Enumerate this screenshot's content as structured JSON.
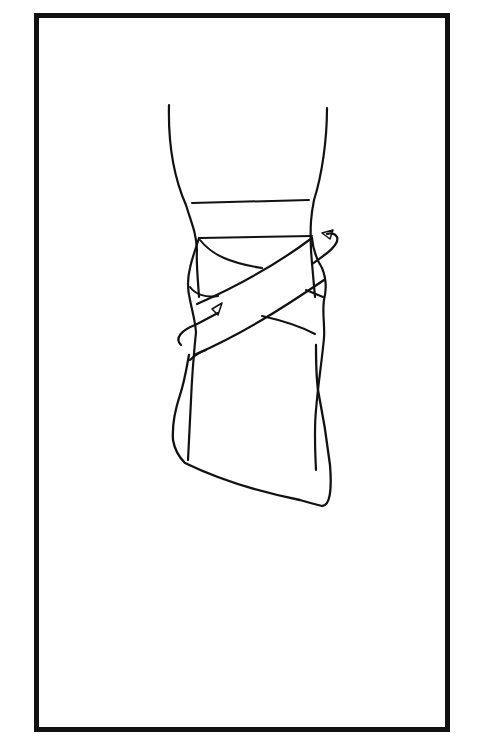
{
  "figure": {
    "frame": {
      "x": 36,
      "y": 15,
      "width": 412,
      "height": 715,
      "stroke_width": 5,
      "color": "#111111"
    },
    "stroke_color": "#111111",
    "background": "#ffffff",
    "elements": [
      "leg-outline",
      "circular-anchor-band",
      "figure-eight-crossing-strap",
      "upper-direction-arrow",
      "lower-direction-arrow",
      "foot-outline"
    ]
  }
}
